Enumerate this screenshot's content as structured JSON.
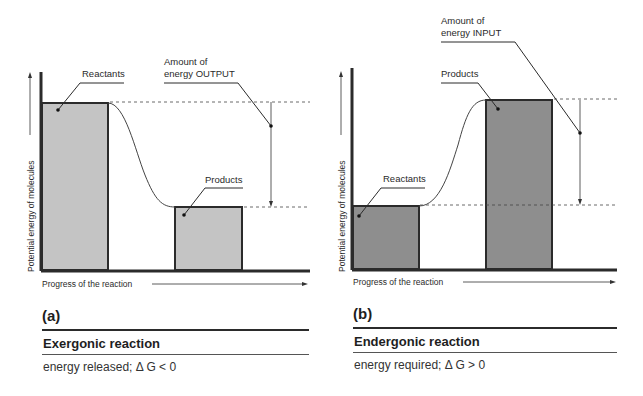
{
  "panels": [
    {
      "letter": "(a)",
      "title": "Exergonic reaction",
      "subtitle": "energy released; Δ G < 0",
      "y_axis_label": "Potential energy of molecules",
      "x_axis_label": "Progress of the reaction",
      "reactants_label": "Reactants",
      "products_label": "Products",
      "energy_label_line1": "Amount of",
      "energy_label_line2": "energy OUTPUT"
    },
    {
      "letter": "(b)",
      "title": "Endergonic reaction",
      "subtitle": "energy required; Δ G > 0",
      "y_axis_label": "Potential energy of molecules",
      "x_axis_label": "Progress of the reaction",
      "reactants_label": "Reactants",
      "products_label": "Products",
      "energy_label_line1": "Amount of",
      "energy_label_line2": "energy INPUT"
    }
  ],
  "colors": {
    "bar_light": "#c4c4c4",
    "bar_dark": "#8e8e8e",
    "line": "#2b2b2b"
  }
}
